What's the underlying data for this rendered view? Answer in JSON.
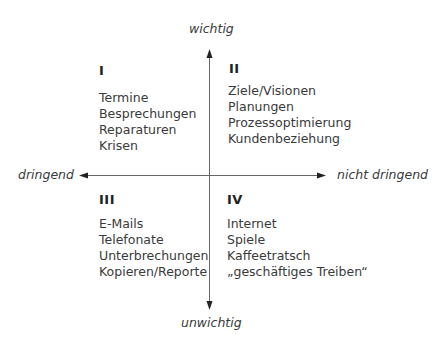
{
  "axes": {
    "top_label": "wichtig",
    "bottom_label": "unwichtig",
    "left_label": "dringend",
    "right_label": "nicht dringend"
  },
  "quadrants": [
    {
      "numeral": "I",
      "items": [
        "Termine",
        "Besprechungen",
        "Reparaturen",
        "Krisen"
      ]
    },
    {
      "numeral": "II",
      "items": [
        "Ziele/Visionen",
        "Planungen",
        "Prozessoptimierung",
        "Kundenbeziehung"
      ]
    },
    {
      "numeral": "III",
      "items": [
        "E-Mails",
        "Telefonate",
        "Unterbrechungen",
        "Kopieren/Reporte"
      ]
    },
    {
      "numeral": "IV",
      "items": [
        "Internet",
        "Spiele",
        "Kaffeetratsch",
        "„geschäftiges Treiben“"
      ]
    }
  ],
  "colors": {
    "text": "#3a3a3a",
    "axis": "#555555",
    "background": "#ffffff"
  }
}
